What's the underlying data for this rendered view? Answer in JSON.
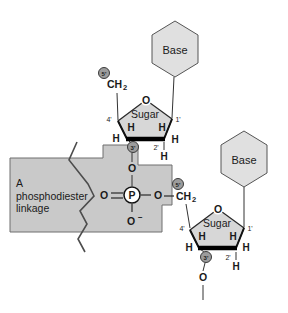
{
  "figure": {
    "callout": {
      "line1": "A",
      "line2": "phosphodiester",
      "line3": "linkage"
    },
    "labels": {
      "base": "Base",
      "sugar": "Sugar",
      "oxygen": "O",
      "hydrogen": "H",
      "phosphorus": "P",
      "ch": "CH",
      "two_sub": "2",
      "minus": "−"
    },
    "primes": {
      "one": "1'",
      "two": "2'",
      "three": "3'",
      "four": "4'",
      "five": "5'"
    },
    "colors": {
      "background": "#ffffff",
      "callout_fill": "#c9c9c9",
      "callout_border": "#6f6f6f",
      "ring_fill": "#d7d7d7",
      "hexagon_fill": "#e0e0e0",
      "marker_fill": "#9c9c9c",
      "phosphorus_circle_fill": "#ffffff",
      "ink": "#1a1a1a"
    }
  }
}
